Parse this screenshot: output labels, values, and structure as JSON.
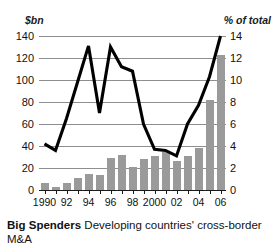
{
  "axes": {
    "left_unit": "$bn",
    "right_unit": "% of total",
    "left_ticks": [
      "0",
      "20",
      "40",
      "60",
      "80",
      "100",
      "120",
      "140"
    ],
    "right_ticks": [
      "0",
      "2",
      "4",
      "6",
      "8",
      "10",
      "12",
      "14"
    ],
    "x_tick_labels": [
      "1990",
      "92",
      "94",
      "96",
      "98",
      "2000",
      "02",
      "04",
      "06"
    ]
  },
  "caption": {
    "title": "Big Spenders",
    "text": "Developing countries' cross-border M&A"
  },
  "colors": {
    "bar": "#9a9a9a",
    "line": "#000000",
    "grid": "#8e8e8e",
    "text": "#111111",
    "background": "#ffffff"
  },
  "chart_data": {
    "type": "bar",
    "title": "Big Spenders",
    "subtitle": "Developing countries' cross-border M&A",
    "xlabel": "",
    "ylabel": "$bn",
    "y2label": "% of total",
    "categories": [
      "1990",
      "1991",
      "1992",
      "1993",
      "1994",
      "1995",
      "1996",
      "1997",
      "1998",
      "1999",
      "2000",
      "2001",
      "2002",
      "2003",
      "2004",
      "2005",
      "2006"
    ],
    "tick_labels_shown": [
      "1990",
      "",
      "92",
      "",
      "94",
      "",
      "96",
      "",
      "98",
      "",
      "2000",
      "",
      "02",
      "",
      "04",
      "",
      "06"
    ],
    "ylim": [
      0,
      140
    ],
    "y2lim": [
      0,
      14
    ],
    "grid": true,
    "legend": "none",
    "series": [
      {
        "name": "Developing countries' cross-border M&A",
        "type": "bar",
        "axis": "left",
        "unit": "$bn",
        "color": "#9a9a9a",
        "values": [
          6,
          3,
          6,
          11,
          15,
          14,
          29,
          32,
          21,
          28,
          31,
          35,
          26,
          31,
          38,
          82,
          123
        ]
      },
      {
        "name": "Share of total",
        "type": "line",
        "axis": "right",
        "unit": "% of total",
        "color": "#000000",
        "values": [
          4.2,
          3.6,
          6.5,
          9.8,
          13.1,
          7.0,
          13.0,
          11.2,
          10.8,
          6.0,
          3.7,
          3.6,
          3.1,
          6.0,
          7.7,
          10.3,
          14.0
        ]
      }
    ]
  }
}
